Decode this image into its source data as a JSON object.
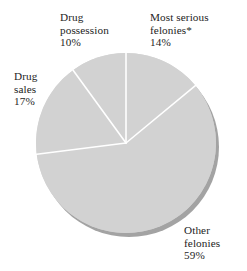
{
  "chart_data": {
    "type": "pie",
    "title": "",
    "subtitle": "",
    "xlabel": "",
    "ylabel": "",
    "grid": false,
    "legend_position": "none",
    "label_style": "outside-callout",
    "start_angle_deg": 0,
    "direction": "clockwise",
    "total_percent": 100,
    "categories": [
      "Most serious felonies*",
      "Other felonies",
      "Drug sales",
      "Drug possession"
    ],
    "values": [
      14,
      59,
      17,
      10
    ],
    "value_unit": "%",
    "slices": [
      {
        "name": "Most serious felonies*",
        "label_line1": "Most serious",
        "label_line2": "felonies*",
        "value": 14,
        "value_label": "14%",
        "start_deg": 0,
        "end_deg": 50.4,
        "color": "#d2d2d2"
      },
      {
        "name": "Other felonies",
        "label_line1": "Other",
        "label_line2": "felonies",
        "value": 59,
        "value_label": "59%",
        "start_deg": 50.4,
        "end_deg": 262.8,
        "color": "#d2d2d2"
      },
      {
        "name": "Drug sales",
        "label_line1": "Drug",
        "label_line2": "sales",
        "value": 17,
        "value_label": "17%",
        "start_deg": 262.8,
        "end_deg": 324.0,
        "color": "#d2d2d2"
      },
      {
        "name": "Drug possession",
        "label_line1": "Drug",
        "label_line2": "possession",
        "value": 10,
        "value_label": "10%",
        "start_deg": 324.0,
        "end_deg": 360.0,
        "color": "#d2d2d2"
      }
    ],
    "colors": {
      "slice_fill": "#d2d2d2",
      "slice_separator": "#ffffff",
      "shadow_rim": "#a3a3a3",
      "background": "#ffffff",
      "text": "#242424"
    },
    "geometry": {
      "center_x": 126,
      "center_y": 143,
      "radius": 90,
      "shadow_offset_x": 3,
      "shadow_offset_y": 4,
      "separator_width": 1.6
    }
  }
}
